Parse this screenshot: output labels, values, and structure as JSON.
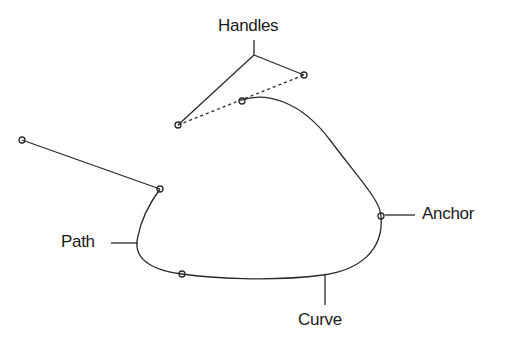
{
  "labels": {
    "handles": "Handles",
    "path": "Path",
    "anchor": "Anchor",
    "curve": "Curve"
  },
  "colors": {
    "line": "#2a2a2a",
    "background": "#ffffff"
  }
}
